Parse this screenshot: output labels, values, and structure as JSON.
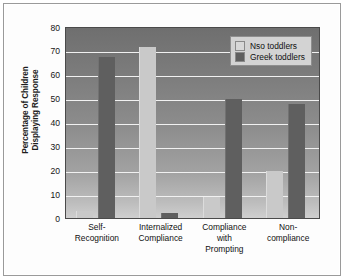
{
  "chart_data": {
    "type": "bar",
    "title": "",
    "xlabel": "",
    "ylabel": "Percentage of Children Displaying Response",
    "ylabel_lines": [
      "Percentage of Children",
      "Displaying Response"
    ],
    "categories": [
      "Self-\nRecognition",
      "Internalized\nCompliance",
      "Compliance\nwith\nPrompting",
      "Non-\ncompliance"
    ],
    "category_lines": [
      [
        "Self-",
        "Recognition"
      ],
      [
        "Internalized",
        "Compliance"
      ],
      [
        "Compliance",
        "with",
        "Prompting"
      ],
      [
        "Non-",
        "compliance"
      ]
    ],
    "ylim": [
      0,
      80
    ],
    "yticks": [
      0,
      10,
      20,
      30,
      40,
      50,
      60,
      70,
      80
    ],
    "ytick_labels": [
      "0",
      "10",
      "20",
      "30",
      "40",
      "50",
      "60",
      "70",
      "80"
    ],
    "grid": true,
    "legend_position": "top-right",
    "series": [
      {
        "name": "Nso toddlers",
        "color": "#c9c9c9",
        "values": [
          3,
          72,
          9,
          20
        ]
      },
      {
        "name": "Greek toddlers",
        "color": "#5f5f5f",
        "values": [
          68,
          2,
          50,
          48
        ]
      }
    ]
  },
  "legend": {
    "items": [
      {
        "label": "Nso toddlers",
        "swatch": "nso"
      },
      {
        "label": "Greek toddlers",
        "swatch": "greek"
      }
    ]
  },
  "colors": {
    "nso": "#c9c9c9",
    "greek": "#5f5f5f",
    "gridline": "#f1f1f1",
    "legend_bg": "#d3d3d3",
    "frame": "#9a9a9a"
  }
}
